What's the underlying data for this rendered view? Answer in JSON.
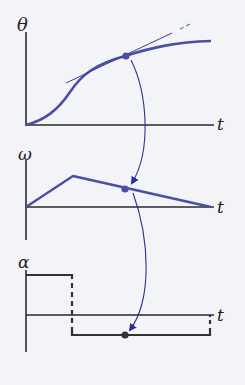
{
  "colors": {
    "background": "#f3f4f8",
    "axis": "#2a2a2a",
    "curve": "#4a4fa6",
    "tangent": "#3a3f8f",
    "arrow": "#2e3192",
    "dot": "#4a4fa6",
    "alpha_line": "#333333"
  },
  "graphs": [
    {
      "id": "theta",
      "y_label": "θ",
      "x_label": "t",
      "description": "angular position vs time, S-curve with tangent line at point"
    },
    {
      "id": "omega",
      "y_label": "ω",
      "x_label": "t",
      "description": "angular velocity vs time, rising then linearly decreasing"
    },
    {
      "id": "alpha",
      "y_label": "α",
      "x_label": "t",
      "description": "angular acceleration vs time, positive constant then negative constant"
    }
  ]
}
